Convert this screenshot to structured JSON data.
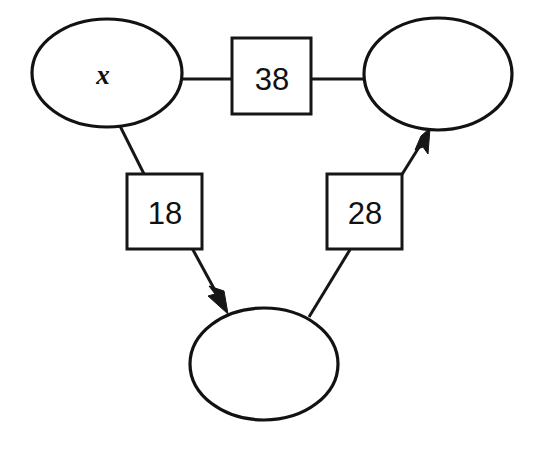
{
  "diagram": {
    "background_color": "#ffffff",
    "stroke_color": "#161616",
    "nodes": [
      {
        "id": "node-top-left",
        "shape": "ellipse",
        "label": "x",
        "cx": 107,
        "cy": 73,
        "rx": 75,
        "ry": 54
      },
      {
        "id": "node-top-right",
        "shape": "ellipse",
        "label": "",
        "cx": 438,
        "cy": 74,
        "rx": 74,
        "ry": 56
      },
      {
        "id": "node-bottom",
        "shape": "ellipse",
        "label": "",
        "cx": 264,
        "cy": 364,
        "rx": 74,
        "ry": 56
      }
    ],
    "edge_boxes": [
      {
        "id": "box-38",
        "label": "38",
        "x": 232,
        "y": 38,
        "w": 79,
        "h": 76
      },
      {
        "id": "box-18",
        "label": "18",
        "x": 127,
        "y": 174,
        "w": 75,
        "h": 75
      },
      {
        "id": "box-28",
        "label": "28",
        "x": 327,
        "y": 174,
        "w": 75,
        "h": 75
      }
    ],
    "edges": [
      {
        "id": "edge-topleft-to-box38",
        "from": "node-top-left",
        "to": "box-38",
        "arrow": false,
        "x1": 182,
        "y1": 79,
        "x2": 232,
        "y2": 79
      },
      {
        "id": "edge-box38-to-topright",
        "from": "box-38",
        "to": "node-top-right",
        "arrow": false,
        "x1": 311,
        "y1": 79,
        "x2": 365,
        "y2": 79
      },
      {
        "id": "edge-topleft-to-box18",
        "from": "node-top-left",
        "to": "box-18",
        "arrow": false,
        "x1": 120,
        "y1": 125,
        "x2": 144,
        "y2": 175
      },
      {
        "id": "edge-box18-to-bottom",
        "from": "box-18",
        "to": "node-bottom",
        "arrow": true,
        "x1": 193,
        "y1": 249,
        "x2": 226,
        "y2": 311
      },
      {
        "id": "edge-bottom-to-box28",
        "from": "node-bottom",
        "to": "box-28",
        "arrow": false,
        "x1": 310,
        "y1": 316,
        "x2": 350,
        "y2": 249
      },
      {
        "id": "edge-box28-to-topright",
        "from": "box-28",
        "to": "node-top-right",
        "arrow": true,
        "x1": 402,
        "y1": 175,
        "x2": 429,
        "y2": 131
      }
    ]
  }
}
